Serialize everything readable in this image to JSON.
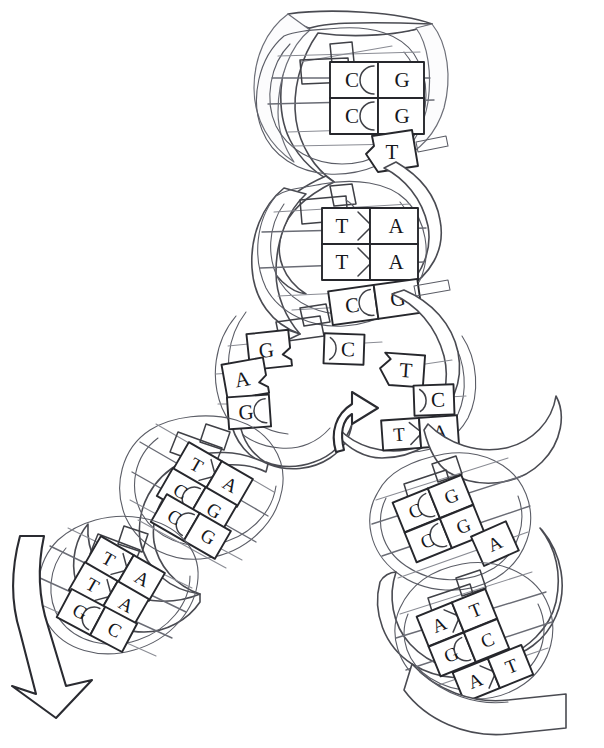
{
  "figure": {
    "background_color": "#ffffff",
    "ink_color": "#3f4046",
    "tile_outline_color": "#26272c",
    "letter_color": "#16171b"
  },
  "segments": [
    {
      "id": "top-helix",
      "name": "top-helix-segment",
      "position": "top",
      "base_pairs": [
        {
          "left": "C",
          "right": "G"
        },
        {
          "left": "C",
          "right": "G"
        },
        {
          "left": "",
          "right": "T"
        }
      ]
    },
    {
      "id": "upper-middle-helix",
      "name": "upper-middle-helix-segment",
      "position": "upper-middle",
      "base_pairs": [
        {
          "left": "T",
          "right": "A"
        },
        {
          "left": "T",
          "right": "A"
        },
        {
          "left": "C",
          "right": "G"
        }
      ]
    },
    {
      "id": "fork-left-strand",
      "name": "replication-fork-left-strand",
      "position": "center-left",
      "unpaired_bases": [
        "G",
        "A",
        "G"
      ]
    },
    {
      "id": "fork-right-strand",
      "name": "replication-fork-right-strand",
      "position": "center-right",
      "unpaired_bases": [
        "C",
        "T",
        "C"
      ],
      "base_pairs": [
        {
          "left": "T",
          "right": "A"
        }
      ]
    },
    {
      "id": "left-middle-helix",
      "name": "left-middle-helix-segment",
      "position": "left-middle",
      "base_pairs": [
        {
          "left": "T",
          "right": "A"
        },
        {
          "left": "C",
          "right": "G"
        },
        {
          "left": "C",
          "right": "G"
        }
      ]
    },
    {
      "id": "left-bottom-helix",
      "name": "left-bottom-helix-segment",
      "position": "bottom-left",
      "base_pairs": [
        {
          "left": "T",
          "right": "A"
        },
        {
          "left": "T",
          "right": "A"
        },
        {
          "left": "G",
          "right": "C"
        }
      ]
    },
    {
      "id": "right-middle-helix",
      "name": "right-middle-helix-segment",
      "position": "right-middle",
      "base_pairs": [
        {
          "left": "C",
          "right": "G"
        },
        {
          "left": "C",
          "right": "G"
        },
        {
          "left": "",
          "right": "A"
        }
      ]
    },
    {
      "id": "right-bottom-helix",
      "name": "right-bottom-helix-segment",
      "position": "bottom-right",
      "base_pairs": [
        {
          "left": "A",
          "right": "T"
        },
        {
          "left": "G",
          "right": "C"
        },
        {
          "left": "A",
          "right": "T"
        }
      ]
    }
  ],
  "bases": {
    "tl1": "C",
    "tr1": "G",
    "tl2": "C",
    "tr2": "G",
    "tr3": "T",
    "ul1": "T",
    "ur1": "A",
    "ul2": "T",
    "ur2": "A",
    "ul3": "C",
    "ur3": "G",
    "fl1": "G",
    "fl2": "A",
    "fl3": "G",
    "fr1": "C",
    "fr2": "T",
    "fr3": "C",
    "fpl": "T",
    "fpr": "A",
    "lm1l": "T",
    "lm1r": "A",
    "lm2l": "C",
    "lm2r": "G",
    "lm3l": "C",
    "lm3r": "G",
    "lb1l": "T",
    "lb1r": "A",
    "lb2l": "T",
    "lb2r": "A",
    "lb3l": "G",
    "lb3r": "C",
    "rm1l": "C",
    "rm1r": "G",
    "rm2l": "C",
    "rm2r": "G",
    "rm3r": "A",
    "rb1l": "A",
    "rb1r": "T",
    "rb2l": "G",
    "rb2r": "C",
    "rb3l": "A",
    "rb3r": "T"
  },
  "arrows": [
    {
      "id": "fork-arrow",
      "name": "fork-direction-arrow",
      "shape": "curved-up-right",
      "position": "center"
    },
    {
      "id": "bottom-left-arrow",
      "name": "replication-direction-arrow",
      "shape": "straight-down",
      "position": "bottom-left"
    }
  ]
}
